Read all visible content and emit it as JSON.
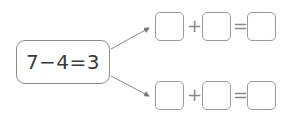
{
  "equation": "7−4=3",
  "top_row": {
    "op1": "+",
    "op2": "="
  },
  "bottom_row": {
    "op1": "+",
    "op2": "="
  },
  "colors": {
    "border": "#8c8c8c",
    "text": "#3a3a3a",
    "arrow": "#8a8a8a"
  }
}
